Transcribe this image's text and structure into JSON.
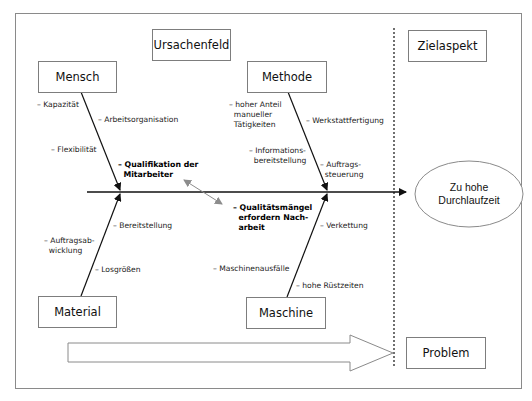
{
  "diagram": {
    "type": "ishikawa-fishbone",
    "headers": {
      "cause_field": "Ursachenfeld",
      "target_aspect": "Zielaspekt",
      "problem": "Problem"
    },
    "effect": {
      "line1": "Zu hohe",
      "line2": "Durchlaufzeit"
    },
    "categories": {
      "mensch": {
        "label": "Mensch",
        "causes": {
          "kapazitaet": "– Kapazität",
          "arbeitsorganisation": "– Arbeitsorganisation",
          "flexibilitaet": "– Flexibilität",
          "qualifikation": "– Qualifikation der\n  Mitarbeiter"
        }
      },
      "methode": {
        "label": "Methode",
        "causes": {
          "manuell": "– hoher Anteil\n  manueller\n  Tätigkeiten",
          "werkstatt": "– Werkstattfertigung",
          "information": "– Informations-\n  bereitstellung",
          "auftragssteuerung": "– Auftrags-\n  steuerung"
        }
      },
      "material": {
        "label": "Material",
        "causes": {
          "bereitstellung": "– Bereitstellung",
          "auftragsabwicklung": "– Auftragsab-\n  wicklung",
          "losgroessen": "– Losgrößen"
        }
      },
      "maschine": {
        "label": "Maschine",
        "causes": {
          "qualitaetsmaengel": "– Qualitätsmängel\n  erfordern Nach-\n  arbeit",
          "verkettung": "– Verkettung",
          "ausfaelle": "– Maschinenausfälle",
          "ruestzeiten": "– hohe Rüstzeiten"
        }
      }
    },
    "colors": {
      "line": "#111111",
      "box_border": "#7d7d7d",
      "frame_border": "#8a8a8a",
      "relation_arrow": "#8c8c8c"
    }
  }
}
